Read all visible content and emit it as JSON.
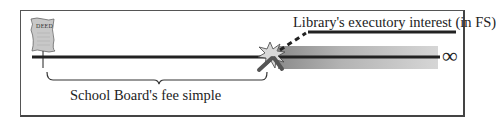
{
  "diagram": {
    "deed_label": "DEED",
    "future_interest_label": "Library's executory interest (in FS)",
    "present_estate_label": "School Board's fee simple",
    "infinity_symbol": "∞"
  },
  "colors": {
    "line": "#222222",
    "band_start": "#9a9a9a",
    "band_end": "#d8d8d8",
    "deed_fill": "#c8c8c8"
  }
}
